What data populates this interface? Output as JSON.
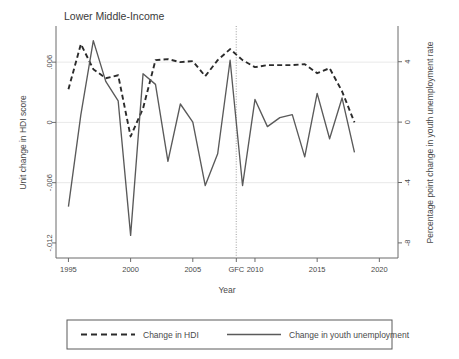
{
  "chart_data": {
    "type": "line",
    "title": "Lower Middle-Income",
    "xlabel": "Year",
    "ylabel_left": "Unit change in HDI score",
    "ylabel_right": "Percentage point change in youth unemployment rate",
    "grid": true,
    "legend_position": "bottom",
    "xlim": [
      1994.0,
      2021.5
    ],
    "ylim_left": [
      -0.0135,
      0.0095
    ],
    "ylim_right": [
      -9.0,
      6.3
    ],
    "xticks": [
      {
        "value": 1995,
        "label": "1995"
      },
      {
        "value": 2000,
        "label": "2000"
      },
      {
        "value": 2005,
        "label": "2005"
      },
      {
        "value": 2008.5,
        "label": "GFC"
      },
      {
        "value": 2010,
        "label": "2010"
      },
      {
        "value": 2015,
        "label": "2015"
      },
      {
        "value": 2020,
        "label": "2020"
      }
    ],
    "yticks_left": [
      {
        "value": 0.006,
        "label": ".006"
      },
      {
        "value": 0.0,
        "label": "0"
      },
      {
        "value": -0.006,
        "label": "-.006"
      },
      {
        "value": -0.012,
        "label": "-.012"
      }
    ],
    "yticks_right": [
      {
        "value": 4,
        "label": "4"
      },
      {
        "value": 0,
        "label": "0"
      },
      {
        "value": -4,
        "label": "-4"
      },
      {
        "value": -8,
        "label": "-8"
      }
    ],
    "gridlines_left": [
      0.006,
      0.0,
      -0.006
    ],
    "annotations": [
      {
        "name": "gfc-marker",
        "type": "vline",
        "x": 2008.5,
        "style": "dotted",
        "label": "GFC"
      }
    ],
    "series": [
      {
        "name": "Change in HDI",
        "axis": "left",
        "style": "dashed",
        "color": "#2b2b2b",
        "x": [
          1995,
          1996,
          1997,
          1998,
          1999,
          2000,
          2001,
          2002,
          2003,
          2004,
          2005,
          2006,
          2007,
          2008,
          2009,
          2010,
          2011,
          2012,
          2013,
          2014,
          2015,
          2016,
          2017,
          2018
        ],
        "values": [
          0.0033,
          0.0078,
          0.0053,
          0.0044,
          0.0047,
          -0.0014,
          0.0014,
          0.0062,
          0.0063,
          0.006,
          0.0061,
          0.0046,
          0.0062,
          0.0073,
          0.0062,
          0.0055,
          0.0057,
          0.0057,
          0.0057,
          0.0058,
          0.0049,
          0.0054,
          0.0031,
          0.0
        ]
      },
      {
        "name": "Change in youth unemployment",
        "axis": "right",
        "style": "solid",
        "color": "#5a5a5a",
        "x": [
          1995,
          1996,
          1997,
          1998,
          1999,
          2000,
          2001,
          2002,
          2003,
          2004,
          2005,
          2006,
          2007,
          2008,
          2009,
          2010,
          2011,
          2012,
          2013,
          2014,
          2015,
          2016,
          2017,
          2018
        ],
        "values": [
          -5.6,
          0.5,
          5.4,
          2.7,
          1.4,
          -7.5,
          3.2,
          2.5,
          -2.6,
          1.2,
          0.0,
          -4.2,
          -2.1,
          4.1,
          -4.2,
          1.5,
          -0.3,
          0.3,
          0.5,
          -2.3,
          1.9,
          -1.1,
          1.6,
          -2.0
        ]
      }
    ]
  },
  "legend": {
    "items": [
      {
        "label": "Change in HDI",
        "style": "dashed"
      },
      {
        "label": "Change in youth unemployment",
        "style": "solid"
      }
    ]
  }
}
